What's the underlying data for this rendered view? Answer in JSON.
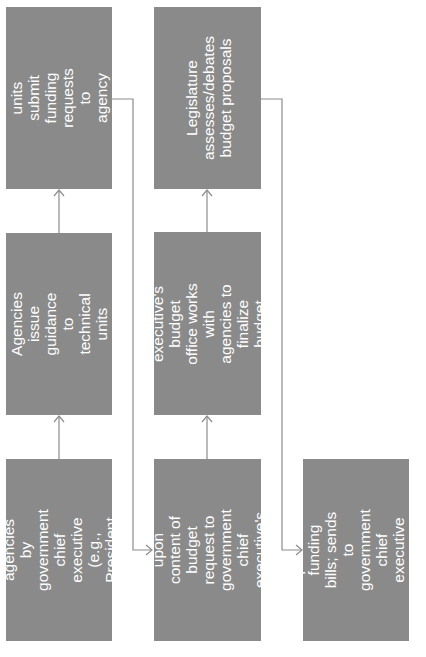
{
  "diagram": {
    "type": "flowchart",
    "orientation": "rotated-90-ccw",
    "colors": {
      "box_fill": "#8a8a8a",
      "box_text": "#ffffff",
      "connector": "#8c8c8c"
    },
    "steps": [
      {
        "id": "step1",
        "text": "Guidance issued to\nagencies by\ngovernment chief\nexecutive (e.g.,\nPresident or\nGovernor)"
      },
      {
        "id": "step2",
        "text": "Agencies issue\nguidance to technical\nunits"
      },
      {
        "id": "step3",
        "text": "Agency's technical\nunits submit funding\nrequests to agency\nbudget office"
      },
      {
        "id": "step4",
        "text": "Agencies decide\nupon content of\nbudget request to\ngovernment chief\nexecutive's budget\noffice"
      },
      {
        "id": "step5",
        "text": "Government chief\nexecutive's budget\noffice works with\nagencies to finalize\nbudget request to\nlegislature"
      },
      {
        "id": "step6",
        "text": "Legislature\nassesses/debates\nbudget proposals"
      },
      {
        "id": "step7",
        "text": "Legislature passes\nfunding bills; sends to\ngovernment chief\nexecutive for final\nsignature"
      }
    ],
    "edges": [
      [
        "step1",
        "step2"
      ],
      [
        "step2",
        "step3"
      ],
      [
        "step3",
        "step4"
      ],
      [
        "step4",
        "step5"
      ],
      [
        "step5",
        "step6"
      ],
      [
        "step6",
        "step7"
      ]
    ]
  }
}
